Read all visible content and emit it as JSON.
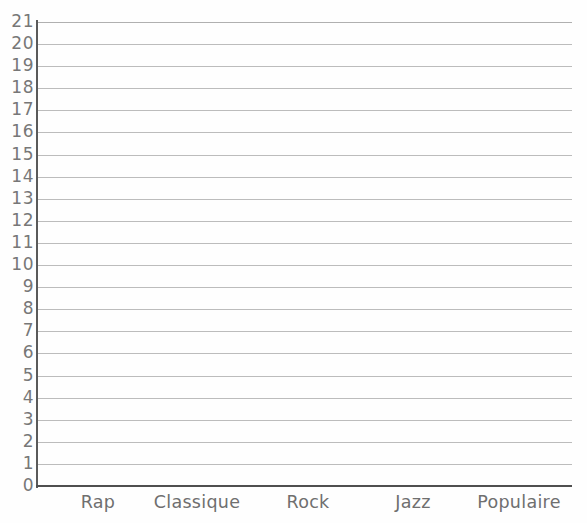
{
  "chart_data": {
    "type": "bar",
    "title": "",
    "subtitle": "",
    "xlabel": "",
    "ylabel": "",
    "categories": [
      "Rap",
      "Classique",
      "Rock",
      "Jazz",
      "Populaire"
    ],
    "values": [
      0,
      0,
      0,
      0,
      0
    ],
    "series": [
      {
        "name": "",
        "values": [
          0,
          0,
          0,
          0,
          0
        ]
      }
    ],
    "ylim": [
      0,
      21
    ],
    "ytick_step": 1,
    "yticks": [
      0,
      1,
      2,
      3,
      4,
      5,
      6,
      7,
      8,
      9,
      10,
      11,
      12,
      13,
      14,
      15,
      16,
      17,
      18,
      19,
      20,
      21
    ],
    "ytick_labels": [
      "0",
      "1",
      "2",
      "3",
      "4",
      "5",
      "6",
      "7",
      "8",
      "9",
      "10",
      "11",
      "12",
      "13",
      "14",
      "15",
      "16",
      "17",
      "18",
      "19",
      "20",
      "21"
    ],
    "grid": true,
    "grid_axis": "y",
    "legend": false,
    "legend_position": "none",
    "annotations": [],
    "note": "Empty grid template — no bars are drawn; all category values are zero."
  },
  "colors": {
    "background": "#fefefe",
    "gridline": "#bcbcbc",
    "axis": "#4f4f4f",
    "y_axis": "#5a5a5a",
    "tick_label": "#777777",
    "category_label": "#6f6f6f"
  },
  "geometry": {
    "plot_left": 37,
    "plot_top": 22,
    "plot_width": 535,
    "plot_height": 464,
    "unit_px": 22,
    "category_centers": [
      98,
      197,
      308,
      413,
      519
    ]
  }
}
